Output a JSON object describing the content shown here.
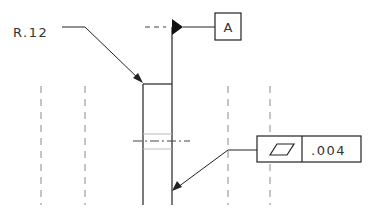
{
  "drawing": {
    "type": "GD&T engineering drawing detail",
    "radius_callout": {
      "label": "R.12",
      "value": ".12"
    },
    "datum": {
      "label": "A"
    },
    "feature_control_frame": {
      "symbol": "flatness",
      "symbol_icon": "parallelogram",
      "tolerance": ".004"
    },
    "colors": {
      "line": "#222222",
      "hidden_line": "#888888",
      "background": "#ffffff"
    }
  }
}
